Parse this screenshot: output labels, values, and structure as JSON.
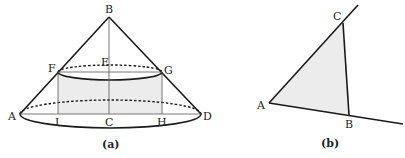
{
  "figure_a": {
    "caption": "(a)",
    "labels": {
      "A": "A",
      "B": "B",
      "C": "C",
      "D": "D",
      "E": "E",
      "F": "F",
      "G": "G",
      "H": "H",
      "I": "I"
    }
  },
  "figure_b": {
    "caption": "(b)",
    "labels": {
      "A": "A",
      "B": "B",
      "C": "C"
    }
  },
  "colors": {
    "stroke": "#1a1a1a",
    "shade": "#ececec",
    "thin": "#555555"
  }
}
